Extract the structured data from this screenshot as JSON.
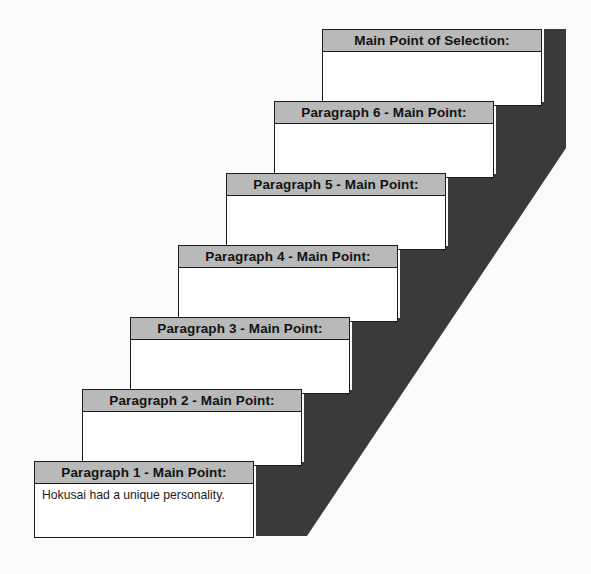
{
  "diagram": {
    "colors": {
      "header_fill": "#b9b9b9",
      "box_fill": "#ffffff",
      "box_border": "#1a1a1a",
      "shadow_fill": "#3a3a3a",
      "page_background": "#fbfbfa",
      "text": "#121212"
    },
    "steps": [
      {
        "id": "paragraph-1",
        "header": "Paragraph 1 - Main Point:",
        "body": "Hokusai had a unique personality."
      },
      {
        "id": "paragraph-2",
        "header": "Paragraph 2 - Main Point:",
        "body": ""
      },
      {
        "id": "paragraph-3",
        "header": "Paragraph 3 - Main Point:",
        "body": ""
      },
      {
        "id": "paragraph-4",
        "header": "Paragraph 4 - Main Point:",
        "body": ""
      },
      {
        "id": "paragraph-5",
        "header": "Paragraph 5 - Main Point:",
        "body": ""
      },
      {
        "id": "paragraph-6",
        "header": "Paragraph 6 - Main Point:",
        "body": ""
      },
      {
        "id": "selection",
        "header": "Main Point of Selection:",
        "body": ""
      }
    ]
  }
}
